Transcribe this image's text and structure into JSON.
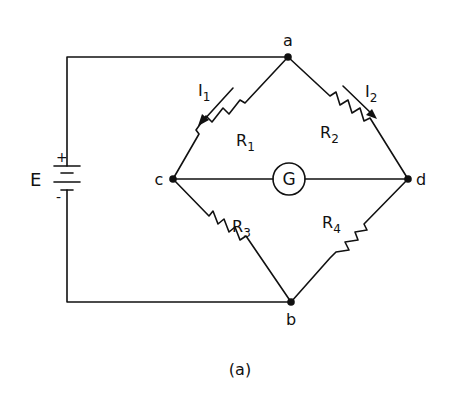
{
  "diagram": {
    "type": "circuit",
    "caption": "(a)",
    "source": {
      "label": "E",
      "plus": "+",
      "minus": "-"
    },
    "nodes": {
      "a": "a",
      "b": "b",
      "c": "c",
      "d": "d"
    },
    "resistors": [
      {
        "id": "R1",
        "label": "R",
        "subscript": "1",
        "from": "a",
        "to": "c"
      },
      {
        "id": "R2",
        "label": "R",
        "subscript": "2",
        "from": "a",
        "to": "d"
      },
      {
        "id": "R3",
        "label": "R",
        "subscript": "3",
        "from": "c",
        "to": "b"
      },
      {
        "id": "R4",
        "label": "R",
        "subscript": "4",
        "from": "d",
        "to": "b"
      }
    ],
    "currents": [
      {
        "id": "I1",
        "label": "I",
        "subscript": "1",
        "branch": "R1",
        "direction": "a-to-c"
      },
      {
        "id": "I2",
        "label": "I",
        "subscript": "2",
        "branch": "R2",
        "direction": "a-to-d"
      }
    ],
    "galvanometer": {
      "label": "G",
      "from": "c",
      "to": "d"
    },
    "colors": {
      "ink": "#111111",
      "background": "#ffffff"
    }
  }
}
